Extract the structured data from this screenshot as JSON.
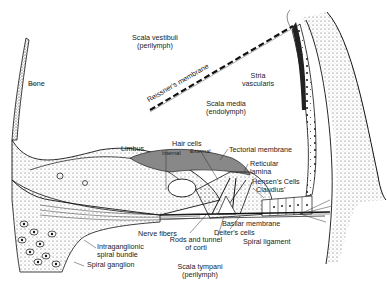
{
  "diagram": {
    "labels": {
      "scala_vestibuli": "Scala vestibuli",
      "scala_vestibuli_sub": "(perilymph)",
      "bone": "Bone",
      "reissners_membrane": "Reissner's membrane",
      "stria_vascularis_1": "Stria",
      "stria_vascularis_2": "vascularis",
      "scala_media": "Scala media",
      "scala_media_sub": "(endolymph)",
      "limbus": "Limbus",
      "hair_cells": "Hair cells",
      "hair_cells_internal": "Internal",
      "hair_cells_external": "External",
      "tectorial_membrane": "Tectorial membrane",
      "reticular_lamina_1": "Reticular",
      "reticular_lamina_2": "lamina",
      "hensens_cells": "Hensen's Cells",
      "claudius": "Claudius'",
      "nerve_fibers": "Nerve fibers",
      "basilar_membrane": "Basilar membrane",
      "deiters_cells": "Deiter's cells",
      "rods_tunnel_1": "Rods and tunnel",
      "rods_tunnel_2": "of corti",
      "spiral_ligament": "Spiral ligament",
      "intraganglionic_1": "Intraganglionic",
      "intraganglionic_2": "spiral bundle",
      "spiral_ganglion": "Spiral ganglion",
      "scala_tympani": "Scala tympani",
      "scala_tympani_sub": "(perilymph)"
    }
  }
}
